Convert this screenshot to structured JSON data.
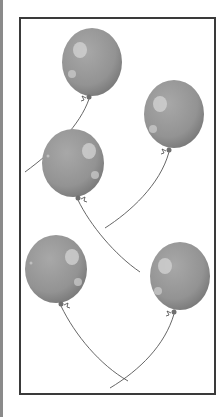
{
  "scene": {
    "description": "Five gray balloons with strings inside a rectangular frame",
    "balloon_count": 5,
    "colors": {
      "frame_border": "#3a3a3a",
      "left_bar": "#8a8a8a",
      "balloon_fill": "#979797",
      "balloon_dark": "#7a7a7a",
      "balloon_highlight": "#d4d4d4",
      "string": "#555555"
    },
    "balloons": [
      {
        "id": 1,
        "cx": 92,
        "cy": 58,
        "rx": 30,
        "ry": 34,
        "highlight_side": "left"
      },
      {
        "id": 2,
        "cx": 174,
        "cy": 111,
        "rx": 30,
        "ry": 34,
        "highlight_side": "left"
      },
      {
        "id": 3,
        "cx": 72,
        "cy": 160,
        "rx": 31,
        "ry": 34,
        "highlight_side": "right"
      },
      {
        "id": 4,
        "cx": 55,
        "cy": 266,
        "rx": 31,
        "ry": 34,
        "highlight_side": "right"
      },
      {
        "id": 5,
        "cx": 180,
        "cy": 273,
        "rx": 30,
        "ry": 34,
        "highlight_side": "left"
      }
    ]
  }
}
